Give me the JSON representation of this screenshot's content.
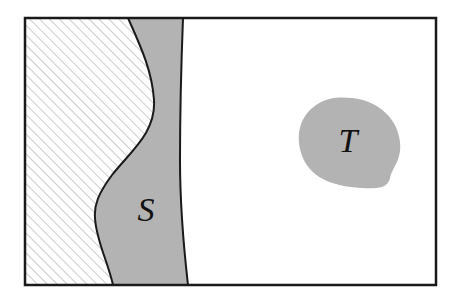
{
  "figure": {
    "width": 461,
    "height": 307,
    "background_color": "#ffffff"
  },
  "frame": {
    "name": "outer-rectangle",
    "x": 25,
    "y": 18,
    "width": 411,
    "height": 267,
    "stroke_color": "#1a1a1a",
    "stroke_width": 2.5,
    "fill_color": "#ffffff"
  },
  "regions": [
    {
      "id": "hatched-region",
      "label": "",
      "fill_style": "diagonal-hatch",
      "hatch_color": "#a0a0a0",
      "hatch_background": "#ffffff",
      "hatch_angle_deg": 45,
      "hatch_spacing_px": 7,
      "hatch_line_width_px": 1.1,
      "description": "left hatched area bounded by the wavy curve"
    },
    {
      "id": "region-s",
      "label": "S",
      "label_x": 146,
      "label_y": 213,
      "label_font_size": 34,
      "fill_color": "#b3b3b3",
      "stroke_color": "#1a1a1a",
      "stroke_width": 2,
      "description": "vertical shaded band between the wavy curve and the near-vertical curve"
    },
    {
      "id": "region-t",
      "label": "T",
      "label_x": 348,
      "label_y": 144,
      "label_font_size": 34,
      "fill_color": "#b3b3b3",
      "stroke_color": "#b3b3b3",
      "stroke_width": 0,
      "description": "irregular rounded blob on the right side"
    }
  ],
  "curves": {
    "wavy_left_boundary": "M 128,18 C 140,45 152,70 154,100 C 156,132 132,150 112,175 C 98,194 94,205 95,218 C 96,240 108,262 113,285",
    "vertical_right_boundary": "M 183,18 C 181,70 180,120 180,160 C 180,210 184,250 188,285",
    "blob_t_outline": "M 352,98 C 380,101 398,120 400,142 C 402,160 392,168 390,178 C 388,188 378,189 362,188 C 338,187 312,180 303,158 C 294,136 300,116 316,105 C 328,97 340,97 352,98"
  },
  "labels": {
    "s": "S",
    "t": "T"
  }
}
